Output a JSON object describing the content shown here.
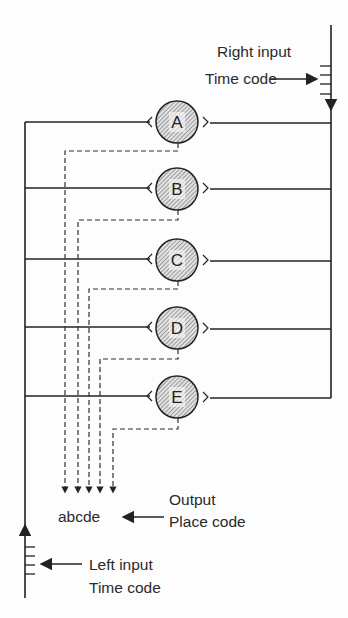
{
  "diagram": {
    "right_input": {
      "line1": "Right input",
      "line2": "Time code"
    },
    "left_input": {
      "line1": "Left input",
      "line2": "Time code"
    },
    "output": {
      "line1": "Output",
      "line2": "Place code",
      "value": "abcde"
    },
    "nodes": [
      {
        "label": "A"
      },
      {
        "label": "B"
      },
      {
        "label": "C"
      },
      {
        "label": "D"
      },
      {
        "label": "E"
      }
    ],
    "colors": {
      "line": "#222222",
      "background": "#fdfdfd",
      "node_fill": "#d9d9d9"
    }
  }
}
